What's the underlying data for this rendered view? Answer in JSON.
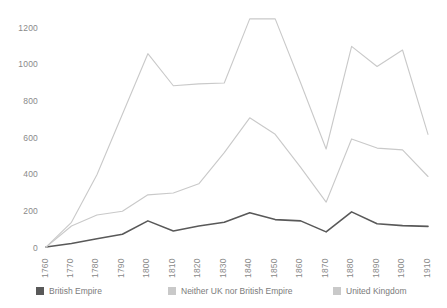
{
  "chart_data": {
    "type": "line",
    "title": "",
    "subtitle": "",
    "xlabel": "",
    "ylabel": "",
    "grid": false,
    "legend_position": "bottom",
    "x": [
      1760,
      1770,
      1780,
      1790,
      1800,
      1810,
      1820,
      1830,
      1840,
      1850,
      1860,
      1870,
      1880,
      1890,
      1900,
      1910
    ],
    "categories": [
      "1760",
      "1770",
      "1780",
      "1790",
      "1800",
      "1810",
      "1820",
      "1830",
      "1840",
      "1850",
      "1860",
      "1870",
      "1880",
      "1890",
      "1900",
      "1910"
    ],
    "xlim": [
      1760,
      1910
    ],
    "ylim": [
      0,
      1280
    ],
    "yticks": [
      0,
      200,
      400,
      600,
      800,
      1000,
      1200
    ],
    "ytick_labels": [
      "0",
      "200",
      "400",
      "600",
      "800",
      "1000",
      "1200"
    ],
    "series": [
      {
        "name": "British Empire",
        "color": "#595959",
        "values": [
          5,
          25,
          50,
          75,
          148,
          93,
          120,
          140,
          192,
          155,
          148,
          88,
          197,
          132,
          122,
          118
        ]
      },
      {
        "name": "Neither UK nor British Empire",
        "color": "#c9c9c9",
        "values": [
          5,
          140,
          400,
          730,
          1060,
          885,
          895,
          900,
          1250,
          1250,
          900,
          540,
          1100,
          990,
          1080,
          620
        ]
      },
      {
        "name": "United Kingdom",
        "color": "#c9c9c9",
        "values": [
          5,
          120,
          180,
          200,
          290,
          300,
          350,
          520,
          710,
          620,
          440,
          250,
          595,
          545,
          535,
          390
        ]
      }
    ]
  },
  "legend": {
    "items": [
      {
        "label": "British Empire",
        "color": "#595959"
      },
      {
        "label": "Neither UK nor British Empire",
        "color": "#c9c9c9"
      },
      {
        "label": "United Kingdom",
        "color": "#c9c9c9"
      }
    ]
  }
}
